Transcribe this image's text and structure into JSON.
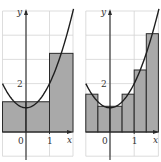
{
  "chart_data": [
    {
      "type": "bar",
      "title": "",
      "description": "Midpoint rectangles approximating area under y = x^2 + 1 on [-1, 2], n = 3",
      "function": "x^2 + 1",
      "xlabel": "x",
      "ylabel": "y",
      "xlim": [
        -1,
        2
      ],
      "ylim": [
        -1,
        5
      ],
      "grid": true,
      "x_tick_labels": [
        {
          "value": 0,
          "label": "0"
        },
        {
          "value": 1,
          "label": "1"
        }
      ],
      "y_tick_labels": [
        {
          "value": 2,
          "label": "2"
        }
      ],
      "bars": [
        {
          "x0": -1,
          "x1": 0,
          "height": 1.25
        },
        {
          "x0": 0,
          "x1": 1,
          "height": 1.25
        },
        {
          "x0": 1,
          "x1": 2,
          "height": 3.25
        }
      ],
      "categories": [
        "[-1,0]",
        "[0,1]",
        "[1,2]"
      ],
      "values": [
        1.25,
        1.25,
        3.25
      ]
    },
    {
      "type": "bar",
      "title": "",
      "description": "Midpoint rectangles approximating area under y = x^2 + 1 on [-1, 2], n = 6",
      "function": "x^2 + 1",
      "xlabel": "x",
      "ylabel": "y",
      "xlim": [
        -1,
        2
      ],
      "ylim": [
        -1,
        5
      ],
      "grid": true,
      "x_tick_labels": [
        {
          "value": 0,
          "label": "0"
        },
        {
          "value": 1,
          "label": "1"
        }
      ],
      "y_tick_labels": [
        {
          "value": 2,
          "label": "2"
        }
      ],
      "bars": [
        {
          "x0": -1,
          "x1": -0.5,
          "height": 1.5625
        },
        {
          "x0": -0.5,
          "x1": 0,
          "height": 1.0625
        },
        {
          "x0": 0,
          "x1": 0.5,
          "height": 1.0625
        },
        {
          "x0": 0.5,
          "x1": 1,
          "height": 1.5625
        },
        {
          "x0": 1,
          "x1": 1.5,
          "height": 2.5625
        },
        {
          "x0": 1.5,
          "x1": 2,
          "height": 4.0625
        }
      ],
      "categories": [
        "[-1,-0.5]",
        "[-0.5,0]",
        "[0,0.5]",
        "[0.5,1]",
        "[1,1.5]",
        "[1.5,2]"
      ],
      "values": [
        1.5625,
        1.0625,
        1.0625,
        1.5625,
        2.5625,
        4.0625
      ]
    }
  ],
  "panels": [
    {
      "x_origin_px": 26,
      "x_unit_px": 23.5,
      "y_origin_px": 132,
      "y_unit_px": 24.2,
      "grid_x": [
        -1,
        0,
        1,
        2
      ],
      "grid_y": [
        -1,
        0,
        1,
        2,
        3,
        4,
        5
      ],
      "axis_top_px": 9,
      "axis_bottom_px": 160,
      "axis_right_px": 73
    },
    {
      "x_origin_px": 110,
      "x_unit_px": 24.2,
      "y_origin_px": 132,
      "y_unit_px": 24.2,
      "grid_x": [
        -1,
        0,
        1,
        2
      ],
      "grid_y": [
        -1,
        0,
        1,
        2,
        3,
        4,
        5
      ],
      "axis_top_px": 9,
      "axis_bottom_px": 160,
      "axis_right_px": 159
    }
  ],
  "colors": {
    "bar_fill": "#a9a9a9",
    "stroke": "#2a2a2a",
    "grid": "#d4d4d4"
  }
}
